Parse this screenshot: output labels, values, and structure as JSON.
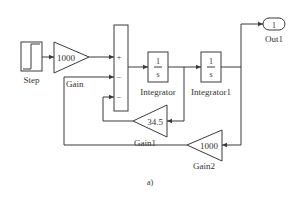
{
  "caption": "a)",
  "colors": {
    "line": "#3a3a3a",
    "text": "#333333",
    "background": "#ffffff"
  },
  "blocks": {
    "step": {
      "label": "Step",
      "icon": "step-signal-icon"
    },
    "gain": {
      "label": "Gain",
      "value": "1000"
    },
    "sum": {
      "signs": [
        "+",
        "−",
        "−"
      ]
    },
    "integrator": {
      "label": "Integrator",
      "numerator": "1",
      "denominator": "s"
    },
    "integrator1": {
      "label": "Integrator1",
      "numerator": "1",
      "denominator": "s"
    },
    "gain1": {
      "label": "Gain1",
      "value": "34.5"
    },
    "gain2": {
      "label": "Gain2",
      "value": "1000"
    },
    "out1": {
      "label": "Out1",
      "port": "1"
    }
  }
}
